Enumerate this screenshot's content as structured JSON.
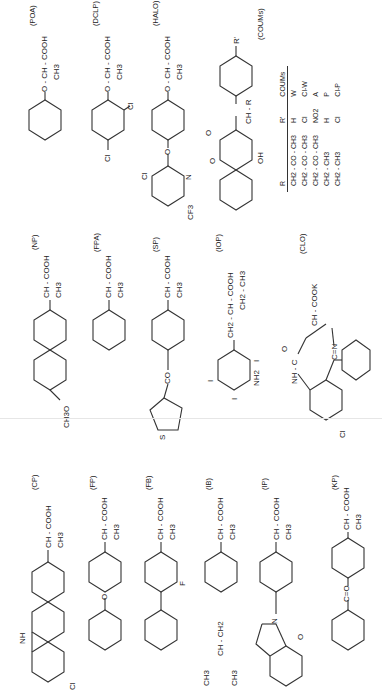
{
  "figure": {
    "orientation": "rotated-90-ccw",
    "columns": [
      {
        "name": "column-1",
        "compounds": [
          {
            "code": "(CP)",
            "name": "carprofen",
            "side_chain": "CH - COOH",
            "branch": "CH3",
            "substituents": [
              "NH",
              "Cl"
            ]
          },
          {
            "code": "(FP)",
            "name": "fenoprofen",
            "side_chain": "CH - COOH",
            "branch": "CH3",
            "substituents": [
              "O"
            ]
          },
          {
            "code": "(FB)",
            "name": "flurbiprofen",
            "side_chain": "CH - COOH",
            "branch": "CH3",
            "substituents": [
              "F"
            ]
          },
          {
            "code": "(IB)",
            "name": "ibuprofen",
            "side_chain": "CH - COOH",
            "branch": "CH3",
            "substituents": [
              "CH3",
              "CH - CH2",
              "CH3"
            ]
          },
          {
            "code": "(IP)",
            "name": "indoprofen",
            "side_chain": "CH - COOH",
            "branch": "CH3",
            "substituents": [
              "N",
              "O"
            ]
          },
          {
            "code": "(KP)",
            "name": "ketoprofen",
            "side_chain": "CH - COOH",
            "branch": "CH3",
            "substituents": [
              "C=O"
            ]
          }
        ]
      },
      {
        "name": "column-2",
        "compounds": [
          {
            "code": "(NP)",
            "name": "naproxen",
            "side_chain": "CH - COOH",
            "branch": "CH3",
            "substituents": [
              "CH3O"
            ]
          },
          {
            "code": "(FPA)",
            "name": "2-phenylpropionic acid",
            "side_chain": "CH - COOH",
            "branch": "CH3",
            "substituents": []
          },
          {
            "code": "(SP)",
            "name": "suprofen",
            "side_chain": "CH - COOH",
            "branch": "CH3",
            "substituents": [
              "CO",
              "S"
            ]
          },
          {
            "code": "(IOP)",
            "name": "iopanoic acid",
            "side_chain": "CH2 - CH - COOH",
            "branch": "CH2 - CH3",
            "substituents": [
              "I",
              "I",
              "I",
              "NH2"
            ]
          },
          {
            "code": "(CLO)",
            "name": "clorazepate",
            "side_chain": "CH - COOK",
            "branch": "",
            "substituents": [
              "NH - C",
              "O",
              "C=N",
              "Cl"
            ]
          }
        ]
      },
      {
        "name": "column-3",
        "compounds": [
          {
            "code": "(POA)",
            "name": "2-phenoxypropionic acid",
            "side_chain": "O - CH - COOH",
            "branch": "CH3",
            "substituents": []
          },
          {
            "code": "(DCLP)",
            "name": "dichlorprop",
            "side_chain": "O - CH - COOH",
            "branch": "CH3",
            "substituents": [
              "Cl",
              "Cl"
            ]
          },
          {
            "code": "(HALO)",
            "name": "haloxyfop",
            "side_chain": "O - CH - COOH",
            "branch": "CH3",
            "substituents": [
              "O",
              "Cl",
              "N",
              "CF3"
            ]
          },
          {
            "code": "(COUMs)",
            "name": "coumarins",
            "side_chain": "CH - R",
            "branch": "",
            "substituents": [
              "O",
              "O",
              "OH",
              "R'"
            ]
          }
        ]
      }
    ],
    "coumarin_table": {
      "headers": [
        "R",
        "R'",
        "COUMs"
      ],
      "rows": [
        [
          "CH2 - CO - CH3",
          "H",
          "W"
        ],
        [
          "CH2 - CO - CH3",
          "Cl",
          "Cl-W"
        ],
        [
          "CH2 - CO - CH3",
          "NO2",
          "A"
        ],
        [
          "CH2 - CH3",
          "H",
          "P"
        ],
        [
          "CH2 - CH3",
          "Cl",
          "Cl-P"
        ]
      ]
    }
  }
}
